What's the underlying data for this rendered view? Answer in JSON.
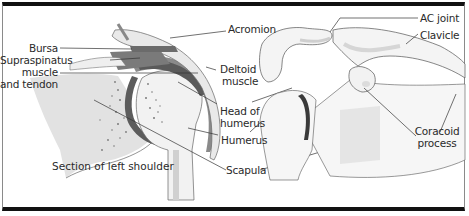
{
  "figure": {
    "caption": "Section of left shoulder",
    "labels": {
      "acromion": "Acromion",
      "bursa": "Bursa",
      "supraspinatus_1": "Supraspinatus",
      "supraspinatus_2": "muscle",
      "supraspinatus_3": "and tendon",
      "deltoid_1": "Deltoid",
      "deltoid_2": "muscle",
      "head_humerus_1": "Head of",
      "head_humerus_2": "humerus",
      "humerus": "Humerus",
      "scapula": "Scapula",
      "ac_joint": "AC joint",
      "clavicle": "Clavicle",
      "coracoid_1": "Coracoid",
      "coracoid_2": "process"
    },
    "colors": {
      "bone_fill": "#f3f3f3",
      "bone_shade": "#dedede",
      "muscle_dark": "#6e6e6e",
      "muscle_mid": "#9a9a9a",
      "outline": "#555555",
      "frame": "#111111"
    }
  }
}
